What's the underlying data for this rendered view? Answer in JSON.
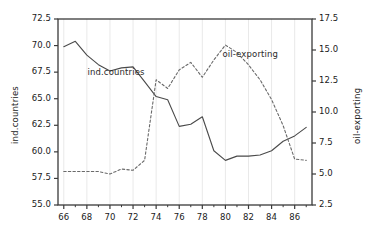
{
  "chart_data": {
    "type": "line",
    "title": "",
    "xlabel": "",
    "ylabel": "ind.countries",
    "ylabel_right": "oil-exporting",
    "grid": true,
    "legend_position": "inline-annotations",
    "x": [
      66,
      67,
      68,
      69,
      70,
      71,
      72,
      73,
      74,
      75,
      76,
      77,
      78,
      79,
      80,
      81,
      82,
      83,
      84,
      85,
      86,
      87
    ],
    "xlim": [
      65.5,
      87.5
    ],
    "xticks": [
      66,
      68,
      70,
      72,
      74,
      76,
      78,
      80,
      82,
      84,
      86
    ],
    "xticklabels": [
      "66",
      "68",
      "70",
      "72",
      "74",
      "76",
      "78",
      "80",
      "82",
      "84",
      "86"
    ],
    "ylim_left": [
      55.0,
      72.5
    ],
    "yticks_left": [
      55.0,
      57.5,
      60.0,
      62.5,
      65.0,
      67.5,
      70.0,
      72.5
    ],
    "yticklabels_left": [
      "55.0",
      "57.5",
      "60.0",
      "62.5",
      "65.0",
      "67.5",
      "70.0",
      "72.5"
    ],
    "ylim_right": [
      2.5,
      17.5
    ],
    "yticks_right": [
      2.5,
      5.0,
      7.5,
      10.0,
      12.5,
      15.0,
      17.5
    ],
    "yticklabels_right": [
      "2.5",
      "5.0",
      "7.5",
      "10.0",
      "12.5",
      "15.0",
      "17.5"
    ],
    "series": [
      {
        "name": "ind.countries",
        "axis": "left",
        "style": "solid",
        "color": "#4a4a4a",
        "label_text": "ind.countries",
        "values": [
          69.9,
          70.4,
          69.1,
          68.2,
          67.6,
          67.9,
          68.0,
          66.6,
          65.2,
          64.9,
          62.4,
          62.6,
          63.3,
          60.1,
          59.2,
          59.6,
          59.6,
          59.7,
          60.1,
          61.0,
          61.5,
          62.3
        ]
      },
      {
        "name": "oil-exporting",
        "axis": "right",
        "style": "dashed",
        "color": "#6a6a6a",
        "label_text": "oil-exporting",
        "values": [
          5.2,
          5.2,
          5.2,
          5.2,
          5.0,
          5.4,
          5.3,
          6.1,
          12.6,
          11.9,
          13.4,
          14.0,
          12.8,
          14.2,
          15.4,
          14.8,
          13.8,
          12.6,
          11.0,
          8.9,
          6.2,
          6.1
        ]
      }
    ],
    "annotations": [
      {
        "text": "ind.countries",
        "x": 70.3,
        "y_left": 67.4
      },
      {
        "text": "oil-exporting",
        "x": 82.0,
        "y_right": 14.6
      }
    ]
  },
  "axis_ticks": {
    "left": [
      "72.5",
      "70.0",
      "67.5",
      "65.0",
      "62.5",
      "60.0",
      "57.5",
      "55.0"
    ],
    "right": [
      "17.5",
      "15.0",
      "12.5",
      "10.0",
      "7.5",
      "5.0",
      "2.5"
    ],
    "bottom": [
      "66",
      "68",
      "70",
      "72",
      "74",
      "76",
      "78",
      "80",
      "82",
      "84",
      "86"
    ]
  },
  "labels": {
    "left_axis_title": "ind.countries",
    "right_axis_title": "oil-exporting"
  },
  "colors": {
    "frame": "#3a3a3a",
    "grid": "#e9e9e9",
    "series_solid": "#4a4a4a",
    "series_dashed": "#6a6a6a",
    "text": "#1a1a1a",
    "background": "#ffffff"
  }
}
